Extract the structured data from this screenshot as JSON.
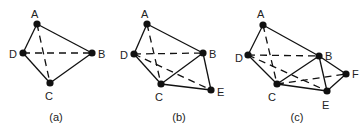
{
  "figures": [
    {
      "caption": "(a)",
      "caption_pos": [
        56,
        121
      ],
      "nodes": [
        {
          "id": "A",
          "x": 37,
          "y": 24,
          "lx": 31,
          "ly": 18
        },
        {
          "id": "B",
          "x": 92,
          "y": 53,
          "lx": 98,
          "ly": 58
        },
        {
          "id": "C",
          "x": 50,
          "y": 83,
          "lx": 45,
          "ly": 100
        },
        {
          "id": "D",
          "x": 23,
          "y": 53,
          "lx": 9,
          "ly": 58
        }
      ],
      "edges": [
        {
          "from": "A",
          "to": "B",
          "style": "solid"
        },
        {
          "from": "A",
          "to": "D",
          "style": "solid"
        },
        {
          "from": "D",
          "to": "C",
          "style": "solid"
        },
        {
          "from": "C",
          "to": "B",
          "style": "solid"
        },
        {
          "from": "D",
          "to": "B",
          "style": "dashed"
        },
        {
          "from": "A",
          "to": "C",
          "style": "dashed"
        }
      ]
    },
    {
      "caption": "(b)",
      "caption_pos": [
        179,
        121
      ],
      "nodes": [
        {
          "id": "A",
          "x": 147,
          "y": 24,
          "lx": 141,
          "ly": 18
        },
        {
          "id": "B",
          "x": 203,
          "y": 53,
          "lx": 209,
          "ly": 58
        },
        {
          "id": "C",
          "x": 161,
          "y": 84,
          "lx": 155,
          "ly": 101
        },
        {
          "id": "D",
          "x": 134,
          "y": 54,
          "lx": 120,
          "ly": 59
        },
        {
          "id": "E",
          "x": 211,
          "y": 90,
          "lx": 217,
          "ly": 96
        }
      ],
      "edges": [
        {
          "from": "A",
          "to": "B",
          "style": "solid"
        },
        {
          "from": "A",
          "to": "D",
          "style": "solid"
        },
        {
          "from": "D",
          "to": "C",
          "style": "solid"
        },
        {
          "from": "C",
          "to": "B",
          "style": "solid"
        },
        {
          "from": "C",
          "to": "E",
          "style": "solid"
        },
        {
          "from": "B",
          "to": "E",
          "style": "solid"
        },
        {
          "from": "D",
          "to": "B",
          "style": "dashed"
        },
        {
          "from": "A",
          "to": "C",
          "style": "dashed"
        },
        {
          "from": "D",
          "to": "E",
          "style": "dashed"
        }
      ]
    },
    {
      "caption": "(c)",
      "caption_pos": [
        297,
        121
      ],
      "nodes": [
        {
          "id": "A",
          "x": 263,
          "y": 25,
          "lx": 257,
          "ly": 18
        },
        {
          "id": "B",
          "x": 319,
          "y": 56,
          "lx": 325,
          "ly": 60
        },
        {
          "id": "C",
          "x": 277,
          "y": 84,
          "lx": 268,
          "ly": 101
        },
        {
          "id": "D",
          "x": 248,
          "y": 55,
          "lx": 235,
          "ly": 62
        },
        {
          "id": "E",
          "x": 327,
          "y": 91,
          "lx": 322,
          "ly": 109
        },
        {
          "id": "F",
          "x": 346,
          "y": 74,
          "lx": 352,
          "ly": 78
        }
      ],
      "edges": [
        {
          "from": "A",
          "to": "B",
          "style": "solid"
        },
        {
          "from": "A",
          "to": "D",
          "style": "solid"
        },
        {
          "from": "D",
          "to": "C",
          "style": "solid"
        },
        {
          "from": "C",
          "to": "B",
          "style": "solid"
        },
        {
          "from": "C",
          "to": "E",
          "style": "solid"
        },
        {
          "from": "B",
          "to": "E",
          "style": "solid"
        },
        {
          "from": "B",
          "to": "F",
          "style": "solid"
        },
        {
          "from": "E",
          "to": "F",
          "style": "solid"
        },
        {
          "from": "D",
          "to": "B",
          "style": "dashed"
        },
        {
          "from": "A",
          "to": "C",
          "style": "dashed"
        },
        {
          "from": "D",
          "to": "E",
          "style": "dashed"
        },
        {
          "from": "C",
          "to": "F",
          "style": "dashed"
        }
      ]
    }
  ]
}
